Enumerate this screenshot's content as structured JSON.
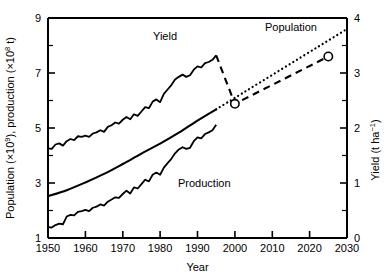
{
  "chart_data": {
    "type": "line",
    "title": "",
    "xlabel": "Year",
    "ylabel_left": "Population (×10⁹), production (×10⁸ t)",
    "ylabel_right": "Yield (t ha⁻¹)",
    "xlim": [
      1950,
      2030
    ],
    "ylim_left": [
      1,
      9
    ],
    "ylim_right": [
      0,
      4
    ],
    "grid": false,
    "legend": "inline-annotations",
    "xticks": [
      1950,
      1960,
      1970,
      1980,
      1990,
      2000,
      2010,
      2020,
      2030
    ],
    "yticks_left": [
      1,
      3,
      5,
      7,
      9
    ],
    "yticks_right": [
      0,
      1,
      2,
      3,
      4
    ],
    "annotations": [
      {
        "text": "Yield",
        "x": 1983,
        "y_left": 8.0
      },
      {
        "text": "Population",
        "x": 2008,
        "y_left": 8.55
      },
      {
        "text": "Production",
        "x": 1990,
        "y_left": 2.55
      }
    ],
    "series": [
      {
        "name": "Yield",
        "axis": "right",
        "style": "solid-observed",
        "units": "t ha⁻¹",
        "x": [
          1950,
          1951,
          1952,
          1953,
          1954,
          1955,
          1956,
          1957,
          1958,
          1959,
          1960,
          1961,
          1962,
          1963,
          1964,
          1965,
          1966,
          1967,
          1968,
          1969,
          1970,
          1971,
          1972,
          1973,
          1974,
          1975,
          1976,
          1977,
          1978,
          1979,
          1980,
          1981,
          1982,
          1983,
          1984,
          1985,
          1986,
          1987,
          1988,
          1989,
          1990,
          1991,
          1992,
          1993,
          1994,
          1995
        ],
        "values": [
          1.63,
          1.62,
          1.7,
          1.72,
          1.68,
          1.76,
          1.8,
          1.78,
          1.85,
          1.84,
          1.86,
          1.84,
          1.9,
          1.92,
          1.96,
          1.93,
          2.02,
          2.05,
          2.1,
          2.08,
          2.15,
          2.2,
          2.16,
          2.25,
          2.22,
          2.3,
          2.38,
          2.36,
          2.48,
          2.52,
          2.47,
          2.62,
          2.7,
          2.78,
          2.88,
          2.93,
          2.97,
          2.93,
          2.96,
          3.06,
          3.12,
          3.1,
          3.18,
          3.2,
          3.24,
          3.32
        ]
      },
      {
        "name": "Yield projection",
        "axis": "right",
        "style": "dashed-projection",
        "units": "t ha⁻¹",
        "x": [
          1995,
          2000,
          2025
        ],
        "values": [
          3.32,
          2.44,
          3.3
        ],
        "markers": [
          {
            "x": 2000,
            "value": 2.44
          },
          {
            "x": 2025,
            "value": 3.3
          }
        ]
      },
      {
        "name": "Population",
        "axis": "left",
        "style": "solid-smooth",
        "units": "×10⁹",
        "x": [
          1950,
          1955,
          1960,
          1965,
          1970,
          1975,
          1980,
          1985,
          1990,
          1995
        ],
        "values": [
          2.52,
          2.74,
          3.02,
          3.33,
          3.69,
          4.07,
          4.43,
          4.83,
          5.27,
          5.68
        ]
      },
      {
        "name": "Population projection",
        "axis": "left",
        "style": "dotted-projection",
        "units": "×10⁹",
        "x": [
          1995,
          2030
        ],
        "values": [
          5.68,
          8.6
        ]
      },
      {
        "name": "Production",
        "axis": "left",
        "style": "solid-observed",
        "units": "×10⁸ t",
        "x": [
          1950,
          1951,
          1952,
          1953,
          1954,
          1955,
          1956,
          1957,
          1958,
          1959,
          1960,
          1961,
          1962,
          1963,
          1964,
          1965,
          1966,
          1967,
          1968,
          1969,
          1970,
          1971,
          1972,
          1973,
          1974,
          1975,
          1976,
          1977,
          1978,
          1979,
          1980,
          1981,
          1982,
          1983,
          1984,
          1985,
          1986,
          1987,
          1988,
          1989,
          1990,
          1991,
          1992,
          1993,
          1994,
          1995
        ],
        "values": [
          1.4,
          1.38,
          1.47,
          1.52,
          1.5,
          1.78,
          1.84,
          1.82,
          1.95,
          1.98,
          2.02,
          1.98,
          2.1,
          2.14,
          2.22,
          2.18,
          2.32,
          2.4,
          2.48,
          2.46,
          2.6,
          2.72,
          2.62,
          2.84,
          2.8,
          2.96,
          3.12,
          3.06,
          3.3,
          3.38,
          3.3,
          3.56,
          3.72,
          3.88,
          4.08,
          4.22,
          4.3,
          4.24,
          4.28,
          4.52,
          4.66,
          4.62,
          4.78,
          4.84,
          4.92,
          5.12
        ]
      }
    ]
  },
  "axes": {
    "x_title": "Year",
    "left_title_parts": {
      "p1": "Population (×10",
      "sup1": "9",
      "p2": "), production (×10",
      "sup2": "8",
      "p3": " t)"
    },
    "right_title_parts": {
      "p1": "Yield (t ha",
      "sup1": "−1",
      "p2": ")"
    }
  },
  "labels": {
    "yield": "Yield",
    "population": "Population",
    "production": "Production"
  },
  "ticks": {
    "x": [
      "1950",
      "1960",
      "1970",
      "1980",
      "1990",
      "2000",
      "2010",
      "2020",
      "2030"
    ],
    "left": [
      "9",
      "7",
      "5",
      "3",
      "1"
    ],
    "right": [
      "4",
      "3",
      "2",
      "1",
      "0"
    ]
  },
  "colors": {
    "ink": "#000000",
    "background": "#ffffff"
  }
}
